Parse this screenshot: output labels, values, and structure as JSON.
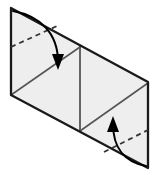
{
  "figure": {
    "type": "origami-fold-step",
    "canvas": {
      "width": 159,
      "height": 175,
      "background": "#ffffff"
    },
    "colors": {
      "paper_fill": "#eeeeee",
      "paper_fill_light": "#f2f2f2",
      "edge_stroke": "#1a1a1a",
      "crease_stroke": "#555555",
      "dashed_stroke": "#333333",
      "arrow_stroke": "#000000",
      "background": "#ffffff"
    },
    "sheet": {
      "name": "parallelogram-sheet",
      "points": "11,8 148,82 148,168 11,95",
      "description": "Rectangular sheet shown in oblique perspective as a parallelogram"
    },
    "panels": [
      {
        "name": "left-panel",
        "points": "11,8 80,46 80,131 11,95",
        "fill": "#eeeeee"
      },
      {
        "name": "right-panel",
        "points": "80,46 148,82 148,168 80,131",
        "fill": "#eeeeee"
      }
    ],
    "edges": [
      {
        "name": "top-edge",
        "x1": 11,
        "y1": 8,
        "x2": 148,
        "y2": 82,
        "width": 2.2
      },
      {
        "name": "right-edge",
        "x1": 148,
        "y1": 82,
        "x2": 148,
        "y2": 168,
        "width": 2.2
      },
      {
        "name": "bottom-edge",
        "x1": 148,
        "y1": 168,
        "x2": 11,
        "y2": 95,
        "width": 2.2
      },
      {
        "name": "left-edge",
        "x1": 11,
        "y1": 95,
        "x2": 11,
        "y2": 8,
        "width": 2.2
      }
    ],
    "creases": [
      {
        "name": "center-vertical-crease",
        "x1": 80,
        "y1": 46,
        "x2": 80,
        "y2": 131,
        "width": 1.8,
        "style": "solid"
      },
      {
        "name": "left-panel-diagonal-crease",
        "x1": 11,
        "y1": 95,
        "x2": 80,
        "y2": 47,
        "width": 1.6,
        "style": "solid"
      },
      {
        "name": "right-panel-diagonal-crease",
        "x1": 80,
        "y1": 131,
        "x2": 148,
        "y2": 83,
        "width": 1.6,
        "style": "solid"
      }
    ],
    "fold_lines": [
      {
        "name": "upper-left-fold-line",
        "x1": 11,
        "y1": 47,
        "x2": 57,
        "y2": 26,
        "style": "dashed",
        "dash_pattern": "5,4",
        "width": 1.8
      },
      {
        "name": "lower-right-fold-line",
        "x1": 104,
        "y1": 152,
        "x2": 148,
        "y2": 130,
        "style": "dashed",
        "dash_pattern": "5,4",
        "width": 1.8
      }
    ],
    "arrows": [
      {
        "name": "fold-down-arrow",
        "path": "M 13,11 C 40,16 58,33 58,62",
        "direction": "down",
        "head_points": "58,70 52,54 64,54",
        "width": 2.0
      },
      {
        "name": "fold-up-arrow",
        "path": "M 146,166 C 124,162 113,147 113,124",
        "direction": "up",
        "head_points": "113,116 107,132 119,132",
        "width": 2.0
      }
    ]
  }
}
